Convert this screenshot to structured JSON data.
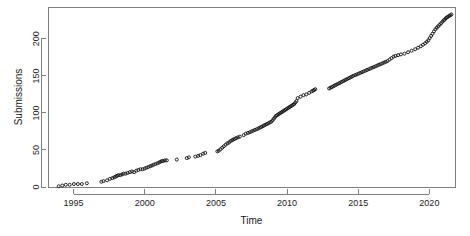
{
  "figure": {
    "width": 470,
    "height": 236,
    "background": "#ffffff",
    "frame_color": "#808080",
    "point_color": "#111111",
    "text_color": "#1a1a1a"
  },
  "plot_box": {
    "left": 48,
    "right": 455,
    "top": 7,
    "bottom": 187
  },
  "chart_data": {
    "type": "scatter",
    "title": "",
    "subtitle": "",
    "xlabel": "Time",
    "ylabel": "Submissions",
    "xlim": [
      1993.3,
      1993.3
    ],
    "x_axis_range": [
      1993.2,
      2021.8
    ],
    "ylim": [
      0,
      243
    ],
    "grid": false,
    "legend": null,
    "legend_position": "none",
    "marker": "open-circle",
    "marker_size": 3,
    "xticks": [
      1995,
      2000,
      2005,
      2010,
      2015,
      2020
    ],
    "xtick_labels": [
      "1995",
      "2000",
      "2005",
      "2010",
      "2015",
      "2020"
    ],
    "yticks": [
      0,
      50,
      100,
      150,
      200
    ],
    "ytick_labels": [
      "0",
      "50",
      "100",
      "150",
      "200"
    ],
    "series": [
      {
        "name": "Cumulative submissions",
        "x": [
          1993.95,
          1994.2,
          1994.45,
          1994.72,
          1995.02,
          1995.3,
          1995.58,
          1995.93,
          1996.95,
          1997.1,
          1997.35,
          1997.55,
          1997.72,
          1997.85,
          1997.95,
          1998.05,
          1998.15,
          1998.28,
          1998.4,
          1998.52,
          1998.66,
          1998.8,
          1998.95,
          1999.1,
          1999.25,
          1999.4,
          1999.55,
          1999.7,
          1999.85,
          2000.0,
          2000.12,
          2000.25,
          2000.38,
          2000.5,
          2000.62,
          2000.75,
          2000.88,
          2001.0,
          2001.1,
          2001.2,
          2001.3,
          2001.42,
          2001.55,
          2002.25,
          2002.95,
          2003.1,
          2003.55,
          2003.75,
          2003.9,
          2004.1,
          2004.25,
          2005.1,
          2005.2,
          2005.32,
          2005.44,
          2005.56,
          2005.68,
          2005.8,
          2005.92,
          2006.02,
          2006.12,
          2006.22,
          2006.32,
          2006.42,
          2006.55,
          2006.68,
          2006.95,
          2007.1,
          2007.25,
          2007.38,
          2007.5,
          2007.62,
          2007.74,
          2007.86,
          2007.98,
          2008.08,
          2008.18,
          2008.28,
          2008.38,
          2008.48,
          2008.58,
          2008.68,
          2008.78,
          2008.88,
          2008.98,
          2009.06,
          2009.14,
          2009.22,
          2009.3,
          2009.38,
          2009.46,
          2009.54,
          2009.62,
          2009.7,
          2009.78,
          2009.86,
          2009.94,
          2010.02,
          2010.1,
          2010.18,
          2010.26,
          2010.34,
          2010.42,
          2010.5,
          2010.58,
          2010.66,
          2010.74,
          2010.95,
          2011.15,
          2011.35,
          2011.55,
          2011.72,
          2011.82,
          2011.9,
          2011.98,
          2012.95,
          2013.05,
          2013.15,
          2013.25,
          2013.35,
          2013.45,
          2013.55,
          2013.65,
          2013.75,
          2013.85,
          2013.95,
          2014.05,
          2014.15,
          2014.25,
          2014.35,
          2014.45,
          2014.55,
          2014.65,
          2014.78,
          2014.9,
          2015.02,
          2015.14,
          2015.26,
          2015.38,
          2015.5,
          2015.62,
          2015.74,
          2015.86,
          2015.98,
          2016.1,
          2016.22,
          2016.34,
          2016.46,
          2016.58,
          2016.7,
          2016.82,
          2016.94,
          2017.06,
          2017.2,
          2017.34,
          2017.48,
          2017.62,
          2017.8,
          2018.0,
          2018.25,
          2018.5,
          2018.75,
          2019.0,
          2019.2,
          2019.4,
          2019.55,
          2019.7,
          2019.82,
          2019.92,
          2020.02,
          2020.12,
          2020.22,
          2020.32,
          2020.42,
          2020.52,
          2020.62,
          2020.72,
          2020.82,
          2020.92,
          2021.0,
          2021.08,
          2021.16,
          2021.24,
          2021.32,
          2021.4,
          2021.48,
          2021.55
        ],
        "y": [
          1,
          2,
          3,
          3,
          4,
          4,
          4,
          5,
          7,
          8,
          9,
          11,
          12,
          13,
          14,
          15,
          16,
          16,
          17,
          18,
          18,
          19,
          20,
          21,
          20,
          22,
          23,
          24,
          24,
          25,
          26,
          27,
          28,
          29,
          30,
          31,
          32,
          33,
          34,
          35,
          35,
          36,
          36,
          37,
          39,
          40,
          41,
          42,
          43,
          45,
          46,
          48,
          49,
          51,
          53,
          55,
          57,
          59,
          60,
          62,
          63,
          64,
          65,
          66,
          67,
          68,
          70,
          72,
          73,
          74,
          75,
          76,
          77,
          78,
          79,
          80,
          81,
          82,
          83,
          84,
          85,
          86,
          87,
          88,
          90,
          92,
          94,
          96,
          97,
          98,
          99,
          100,
          101,
          102,
          103,
          104,
          105,
          106,
          107,
          108,
          109,
          110,
          111,
          112,
          114,
          116,
          120,
          122,
          124,
          125,
          127,
          129,
          130,
          131,
          132,
          133,
          134,
          135,
          136,
          137,
          138,
          139,
          140,
          141,
          142,
          143,
          144,
          145,
          146,
          147,
          148,
          149,
          150,
          151,
          152,
          153,
          154,
          155,
          156,
          157,
          158,
          159,
          160,
          161,
          162,
          163,
          164,
          165,
          166,
          167,
          168,
          169,
          170,
          172,
          174,
          176,
          177,
          178,
          179,
          180,
          182,
          184,
          186,
          188,
          190,
          192,
          194,
          196,
          198,
          201,
          204,
          207,
          210,
          213,
          215,
          217,
          219,
          221,
          223,
          225,
          226,
          228,
          229,
          230,
          231,
          232,
          233
        ]
      }
    ]
  }
}
